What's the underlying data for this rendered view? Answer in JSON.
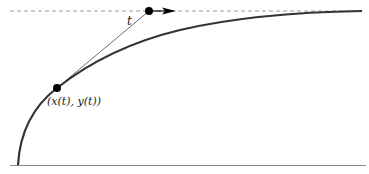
{
  "diagram": {
    "type": "pursuit-curve (tractrix) illustration",
    "labels": {
      "segment_label": "t",
      "point_label": "(x(t), y(t))"
    },
    "colors": {
      "curve": "#333333",
      "tangent": "#444444",
      "asymptote": "#999999",
      "baseline": "#888888",
      "points": "#000000"
    },
    "elements": {
      "asymptote": {
        "style": "dashed",
        "y": 11,
        "x_start": 10,
        "x_end": 362
      },
      "baseline": {
        "y": 165,
        "x_start": 10,
        "x_end": 366
      },
      "curve_point": {
        "x": 57,
        "y": 88
      },
      "leader_point": {
        "x": 149,
        "y": 11
      },
      "arrow_direction": "right"
    }
  }
}
